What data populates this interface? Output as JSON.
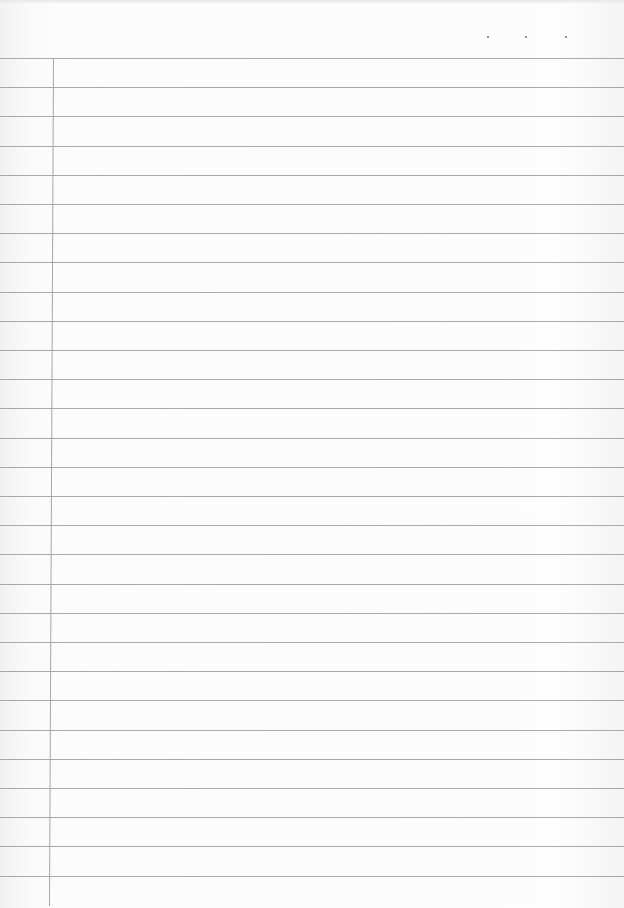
{
  "page": {
    "type": "lined-notebook-paper",
    "rule_count": 29,
    "first_rule_y": 58,
    "rule_spacing": 29.2,
    "margin_x": 53,
    "header_dots": [
      {
        "x": 487,
        "y": 36
      },
      {
        "x": 525,
        "y": 36
      },
      {
        "x": 565,
        "y": 36
      }
    ],
    "colors": {
      "paper": "#fbfbfb",
      "rule": "#a9a9a9",
      "margin": "#a6a6a6",
      "dot": "#6e6e6e"
    }
  }
}
